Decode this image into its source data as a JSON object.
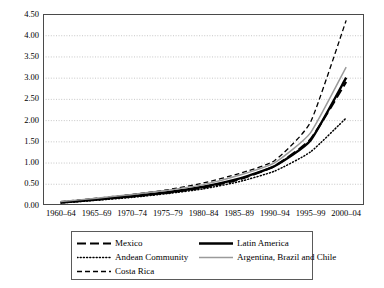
{
  "chart_data": {
    "type": "line",
    "title": "",
    "xlabel": "",
    "ylabel": "",
    "ylim": [
      0.0,
      4.5
    ],
    "ytick_step": 0.5,
    "grid": true,
    "legend_position": "below-plot",
    "categories": [
      "1960–64",
      "1965–69",
      "1970–74",
      "1975–79",
      "1980–84",
      "1985–89",
      "1990–94",
      "1995–99",
      "2000–04"
    ],
    "ytick_labels": [
      "0.00",
      "0.50",
      "1.00",
      "1.50",
      "2.00",
      "2.50",
      "3.00",
      "3.50",
      "4.00",
      "4.50"
    ],
    "series": [
      {
        "name": "Mexico",
        "style": "long-dash",
        "color": "#000000",
        "width": 2.1,
        "values": [
          0.06,
          0.13,
          0.2,
          0.29,
          0.41,
          0.6,
          0.92,
          1.55,
          2.9
        ]
      },
      {
        "name": "Andean Community",
        "style": "dotted",
        "color": "#000000",
        "width": 1.5,
        "values": [
          0.05,
          0.11,
          0.18,
          0.27,
          0.38,
          0.55,
          0.8,
          1.25,
          2.05
        ]
      },
      {
        "name": "Costa Rica",
        "style": "dash",
        "color": "#000000",
        "width": 1.3,
        "values": [
          0.08,
          0.16,
          0.25,
          0.36,
          0.52,
          0.74,
          1.05,
          1.95,
          4.35
        ]
      },
      {
        "name": "Latin America",
        "style": "solid",
        "color": "#000000",
        "width": 2.4,
        "values": [
          0.06,
          0.13,
          0.21,
          0.3,
          0.43,
          0.62,
          0.92,
          1.52,
          3.0
        ]
      },
      {
        "name": "Argentina, Brazil and Chile",
        "style": "solid",
        "color": "#9a9a9a",
        "width": 1.5,
        "values": [
          0.08,
          0.16,
          0.25,
          0.35,
          0.48,
          0.7,
          1.0,
          1.7,
          3.25
        ]
      }
    ]
  },
  "legend": {
    "entries": [
      {
        "label": "Mexico"
      },
      {
        "label": "Latin America"
      },
      {
        "label": "Andean Community"
      },
      {
        "label": "Argentina, Brazil and Chile"
      },
      {
        "label": "Costa Rica"
      }
    ]
  },
  "colors": {
    "axis": "#4a4a4a",
    "grid": "#b9b9b9",
    "series_black": "#000000",
    "series_gray": "#9a9a9a",
    "legend_border": "#5a5a5a"
  }
}
